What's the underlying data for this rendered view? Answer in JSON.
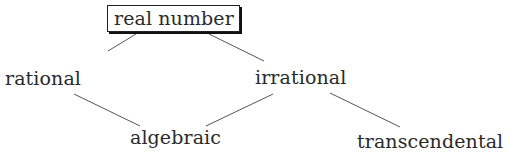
{
  "diagram": {
    "type": "hierarchy",
    "nodes": [
      {
        "id": "real",
        "label": "real number",
        "boxed": true
      },
      {
        "id": "rational",
        "label": "rational",
        "boxed": false
      },
      {
        "id": "irrational",
        "label": "irrational",
        "boxed": false
      },
      {
        "id": "algebraic",
        "label": "algebraic",
        "boxed": false
      },
      {
        "id": "transcendental",
        "label": "transcendental",
        "boxed": false
      }
    ],
    "edges": [
      {
        "from": "real",
        "to": "rational"
      },
      {
        "from": "real",
        "to": "irrational"
      },
      {
        "from": "rational",
        "to": "algebraic"
      },
      {
        "from": "irrational",
        "to": "algebraic"
      },
      {
        "from": "irrational",
        "to": "transcendental"
      }
    ]
  }
}
